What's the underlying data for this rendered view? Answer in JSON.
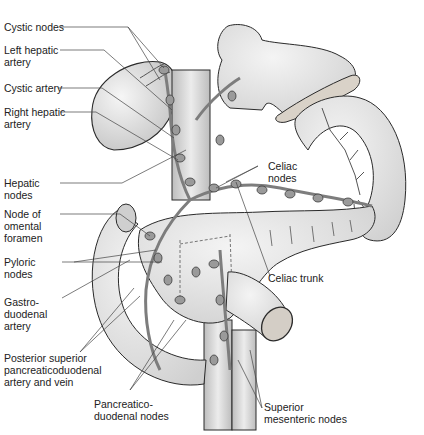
{
  "figure": {
    "colors": {
      "organ_fill": "#e4e4e4",
      "organ_shade": "#c8c8c8",
      "outline": "#2a2a2a",
      "vessel": "#8a8a8a",
      "node": "#9a9a9a",
      "leader_line": "#444444",
      "text": "#222222"
    }
  },
  "labels": {
    "left": [
      {
        "id": "cystic-nodes",
        "text": "Cystic nodes"
      },
      {
        "id": "left-hepatic-artery",
        "text": "Left hepatic\nartery"
      },
      {
        "id": "cystic-artery",
        "text": "Cystic artery"
      },
      {
        "id": "right-hepatic-artery",
        "text": "Right hepatic\nartery"
      },
      {
        "id": "hepatic-nodes",
        "text": "Hepatic\nnodes"
      },
      {
        "id": "node-of-omental-foramen",
        "text": "Node of\nomental\nforamen"
      },
      {
        "id": "pyloric-nodes",
        "text": "Pyloric\nnodes"
      },
      {
        "id": "gastroduodenal-artery",
        "text": "Gastro-\nduodenal\nartery"
      },
      {
        "id": "posterior-superior-pd-artery-vein",
        "text": "Posterior superior\npancreaticoduodenal\nartery and vein"
      }
    ],
    "bottom": [
      {
        "id": "pancreaticoduodenal-nodes",
        "text": "Pancreatico-\nduodenal nodes"
      },
      {
        "id": "superior-mesenteric-nodes",
        "text": "Superior\nmesenteric nodes"
      }
    ],
    "right": [
      {
        "id": "celiac-nodes",
        "text": "Celiac\nnodes"
      },
      {
        "id": "celiac-trunk",
        "text": "Celiac trunk"
      }
    ]
  }
}
